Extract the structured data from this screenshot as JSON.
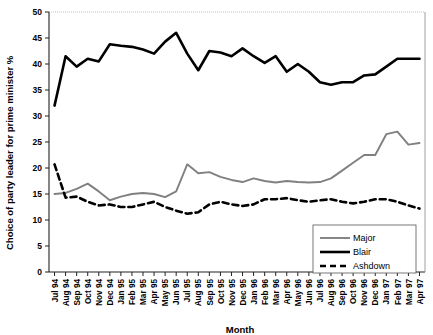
{
  "chart_data": {
    "type": "line",
    "title": "",
    "xlabel": "Month",
    "ylabel": "Choice of party leader for prime minister %",
    "ylim": [
      0,
      50
    ],
    "yticks": [
      0,
      5,
      10,
      15,
      20,
      25,
      30,
      35,
      40,
      45,
      50
    ],
    "grid": false,
    "legend_position": "bottom-right",
    "categories": [
      "Jul 94",
      "Aug 94",
      "Sep 94",
      "Oct 94",
      "Nov 94",
      "Dec 94",
      "Jan 95",
      "Feb 95",
      "Mar 95",
      "Apr 95",
      "May 95",
      "Jun 95",
      "Jul 95",
      "Aug 95",
      "Sep 95",
      "Oct 95",
      "Nov 95",
      "Dec 95",
      "Jan 96",
      "Feb 96",
      "Mar 96",
      "Apr 96",
      "May 96",
      "Jun 96",
      "Jul 96",
      "Aug 96",
      "Sep 96",
      "Oct 96",
      "Nov 96",
      "Dec 96",
      "Jan 97",
      "Feb 97",
      "Mar 97",
      "Apr 97"
    ],
    "series": [
      {
        "name": "Major",
        "color": "#808080",
        "style": "solid",
        "values": [
          15,
          15.2,
          16,
          17,
          15.5,
          13.8,
          14.5,
          15,
          15.2,
          15,
          14.4,
          15.5,
          20.7,
          19,
          19.2,
          18.3,
          17.7,
          17.3,
          18,
          17.5,
          17.2,
          17.5,
          17.3,
          17.2,
          17.3,
          18,
          19.5,
          21,
          22.5,
          22.5,
          26.5,
          27,
          24.5,
          24.8
        ]
      },
      {
        "name": "Blair",
        "color": "#000000",
        "style": "solid",
        "values": [
          32,
          41.5,
          39.5,
          41,
          40.5,
          43.8,
          43.5,
          43.3,
          42.8,
          42,
          44.3,
          46,
          42,
          38.8,
          42.5,
          42.2,
          41.5,
          43,
          41.5,
          40.2,
          41.5,
          38.5,
          40,
          38.5,
          36.5,
          36,
          36.5,
          36.5,
          37.8,
          38,
          39.5,
          41,
          41,
          41
        ]
      },
      {
        "name": "Ashdown",
        "color": "#000000",
        "style": "dashed",
        "values": [
          20.7,
          14.3,
          14.5,
          13.5,
          12.8,
          13,
          12.5,
          12.5,
          13,
          13.5,
          12.5,
          11.8,
          11.2,
          11.5,
          13,
          13.5,
          13,
          12.7,
          13,
          14,
          14,
          14.2,
          13.8,
          13.5,
          13.8,
          14,
          13.5,
          13.2,
          13.5,
          14,
          14,
          13.5,
          12.8,
          12.2
        ]
      }
    ]
  },
  "legend": {
    "items": [
      {
        "label": "Major"
      },
      {
        "label": "Blair"
      },
      {
        "label": "Ashdown"
      }
    ]
  }
}
